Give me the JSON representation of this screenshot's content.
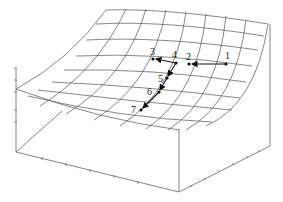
{
  "figure": {
    "type": "3d-surface-wireframe",
    "colors": {
      "mesh": "#555555",
      "box": "#555555",
      "path": "#111111",
      "label": "#222222"
    },
    "points": [
      {
        "label": "1",
        "x": 226,
        "y": 64
      },
      {
        "label": "2",
        "x": 189,
        "y": 64
      },
      {
        "label": "3",
        "x": 153,
        "y": 59
      },
      {
        "label": "4",
        "x": 176,
        "y": 63
      },
      {
        "label": "5",
        "x": 167,
        "y": 78
      },
      {
        "label": "6",
        "x": 159,
        "y": 92
      },
      {
        "label": "7",
        "x": 141,
        "y": 110
      }
    ],
    "path_order": [
      "1",
      "2",
      "4",
      "3",
      "4",
      "5",
      "6",
      "7"
    ]
  }
}
